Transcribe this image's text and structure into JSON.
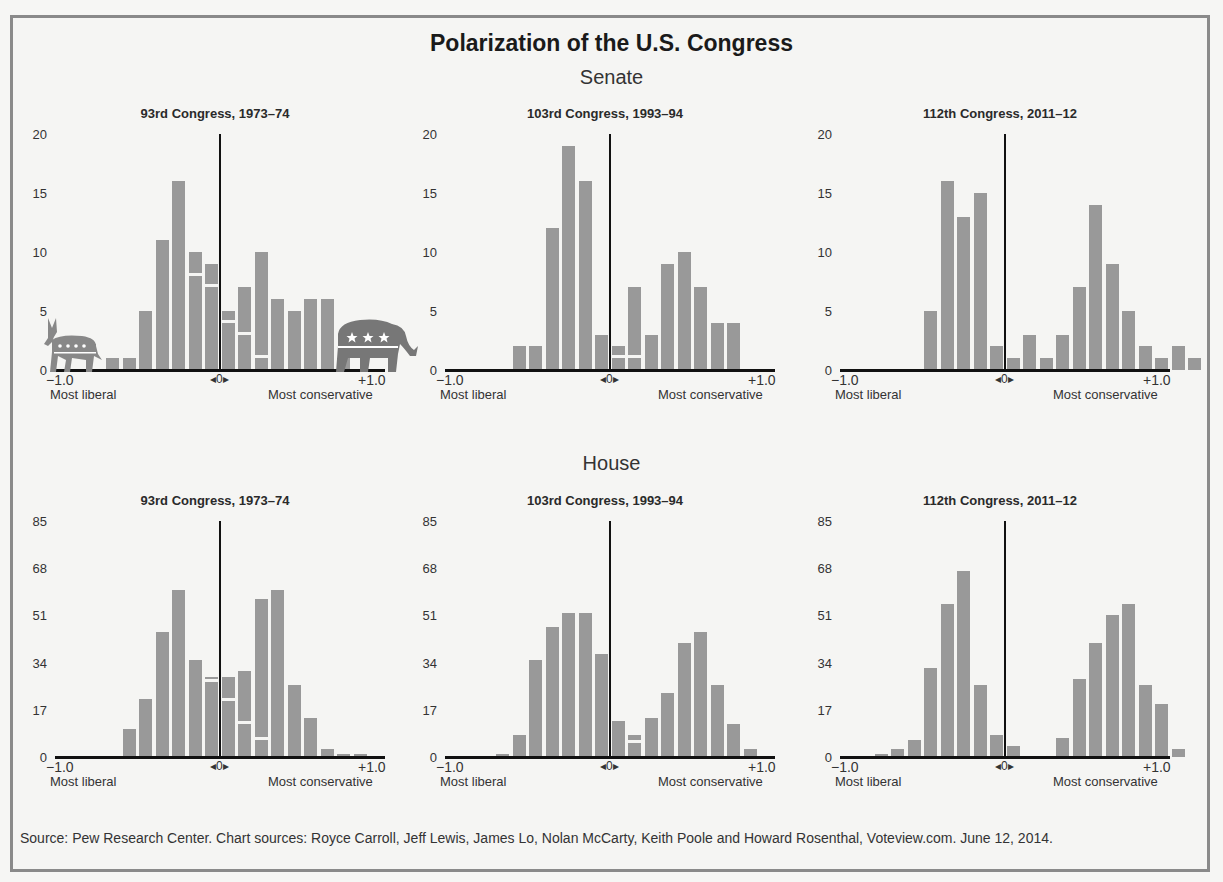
{
  "title": "Polarization of the U.S. Congress",
  "sections": {
    "senate": "Senate",
    "house": "House"
  },
  "axis": {
    "left_value": "−1.0",
    "center_value": "◂0▸",
    "right_value": "+1.0",
    "left_label": "Most liberal",
    "right_label": "Most conservative"
  },
  "icons": {
    "democrat": "donkey-icon",
    "republican": "elephant-icon"
  },
  "colors": {
    "bar": "#999999",
    "axis": "#111111",
    "background": "#f5f5f3"
  },
  "source": "Source: Pew Research Center. Chart sources: Royce Carroll, Jeff Lewis, James Lo, Nolan McCarty, Keith Poole and Howard Rosenthal, Voteview.com. June 12, 2014.",
  "chart_data": [
    {
      "type": "bar",
      "chamber": "Senate",
      "title": "93rd Congress, 1973–74",
      "xlabel": "Ideology (−1.0 most liberal to +1.0 most conservative)",
      "ylabel": "Number of members",
      "yticks": [
        "0",
        "5",
        "10",
        "15",
        "20"
      ],
      "ylim": [
        0,
        20
      ],
      "xlim": [
        -1.0,
        1.0
      ],
      "bin_width": 0.1,
      "bins": [
        -0.7,
        -0.6,
        -0.5,
        -0.4,
        -0.3,
        -0.2,
        -0.1,
        0.0,
        0.1,
        0.2,
        0.3,
        0.4,
        0.5,
        0.6
      ],
      "series": [
        {
          "name": "Democrats",
          "values": [
            1,
            1,
            5,
            11,
            16,
            8,
            7,
            4,
            3,
            1,
            0,
            0,
            0,
            0
          ]
        },
        {
          "name": "Republicans",
          "values": [
            0,
            0,
            0,
            0,
            0,
            2,
            2,
            1,
            4,
            9,
            6,
            5,
            6,
            6
          ]
        }
      ],
      "totals": [
        1,
        1,
        5,
        11,
        16,
        10,
        9,
        5,
        7,
        10,
        6,
        5,
        6,
        6
      ],
      "extra_bins": [
        {
          "bin": 0.7,
          "value": 1
        }
      ]
    },
    {
      "type": "bar",
      "chamber": "Senate",
      "title": "103rd Congress, 1993–94",
      "yticks": [
        "0",
        "5",
        "10",
        "15",
        "20"
      ],
      "ylim": [
        0,
        20
      ],
      "xlim": [
        -1.0,
        1.0
      ],
      "bin_width": 0.1,
      "bins": [
        -0.6,
        -0.5,
        -0.4,
        -0.3,
        -0.2,
        -0.1,
        0.0,
        0.1,
        0.2,
        0.3,
        0.4,
        0.5,
        0.6,
        0.7
      ],
      "series": [
        {
          "name": "Democrats",
          "values": [
            2,
            2,
            12,
            19,
            16,
            3,
            1,
            1,
            0,
            0,
            0,
            0,
            0,
            0
          ]
        },
        {
          "name": "Republicans",
          "values": [
            0,
            0,
            0,
            0,
            0,
            0,
            1,
            6,
            3,
            9,
            10,
            7,
            4,
            4
          ]
        }
      ],
      "totals": [
        2,
        2,
        12,
        19,
        16,
        3,
        2,
        7,
        3,
        9,
        10,
        7,
        4,
        4
      ]
    },
    {
      "type": "bar",
      "chamber": "Senate",
      "title": "112th Congress, 2011–12",
      "yticks": [
        "0",
        "5",
        "10",
        "15",
        "20"
      ],
      "ylim": [
        0,
        20
      ],
      "xlim": [
        -1.0,
        1.0
      ],
      "bin_width": 0.1,
      "bins": [
        -0.5,
        -0.4,
        -0.3,
        -0.2,
        -0.1,
        0.0,
        0.1,
        0.2,
        0.3,
        0.4,
        0.5,
        0.6,
        0.7,
        0.8,
        0.9
      ],
      "series": [
        {
          "name": "Democrats",
          "values": [
            5,
            16,
            13,
            15,
            2,
            1,
            0,
            0,
            0,
            0,
            0,
            0,
            0,
            0,
            0
          ]
        },
        {
          "name": "Republicans",
          "values": [
            0,
            0,
            0,
            0,
            0,
            0,
            3,
            1,
            3,
            7,
            14,
            9,
            5,
            2,
            1
          ]
        }
      ],
      "totals": [
        5,
        16,
        13,
        15,
        2,
        1,
        3,
        1,
        3,
        7,
        14,
        9,
        5,
        2,
        1
      ],
      "extra_bins": [
        {
          "bin": 1.0,
          "value": 2
        },
        {
          "bin": 1.1,
          "value": 1
        }
      ]
    },
    {
      "type": "bar",
      "chamber": "House",
      "title": "93rd Congress, 1973–74",
      "yticks": [
        "0",
        "17",
        "34",
        "51",
        "68",
        "85"
      ],
      "ylim": [
        0,
        85
      ],
      "xlim": [
        -1.0,
        1.0
      ],
      "bin_width": 0.1,
      "bins": [
        -0.6,
        -0.5,
        -0.4,
        -0.3,
        -0.2,
        -0.1,
        0.0,
        0.1,
        0.2,
        0.3,
        0.4,
        0.5,
        0.6,
        0.7,
        0.8
      ],
      "series": [
        {
          "name": "Democrats",
          "values": [
            10,
            21,
            45,
            60,
            35,
            27,
            20,
            12,
            6,
            0,
            0,
            0,
            0,
            0,
            0
          ]
        },
        {
          "name": "Republicans",
          "values": [
            0,
            0,
            0,
            0,
            0,
            2,
            9,
            19,
            51,
            60,
            26,
            14,
            3,
            1,
            1
          ]
        }
      ],
      "totals": [
        10,
        21,
        45,
        60,
        35,
        29,
        29,
        31,
        57,
        60,
        26,
        14,
        3,
        1,
        1
      ]
    },
    {
      "type": "bar",
      "chamber": "House",
      "title": "103rd Congress, 1993–94",
      "yticks": [
        "0",
        "17",
        "34",
        "51",
        "68",
        "85"
      ],
      "ylim": [
        0,
        85
      ],
      "xlim": [
        -1.0,
        1.0
      ],
      "bin_width": 0.1,
      "bins": [
        -0.7,
        -0.6,
        -0.5,
        -0.4,
        -0.3,
        -0.2,
        -0.1,
        0.0,
        0.1,
        0.2,
        0.3,
        0.4,
        0.5,
        0.6,
        0.7,
        0.8
      ],
      "series": [
        {
          "name": "Democrats",
          "values": [
            1,
            8,
            35,
            47,
            52,
            52,
            37,
            13,
            5,
            0,
            0,
            0,
            0,
            0,
            0,
            0
          ]
        },
        {
          "name": "Republicans",
          "values": [
            0,
            0,
            0,
            0,
            0,
            0,
            0,
            0,
            3,
            14,
            23,
            41,
            45,
            26,
            12,
            3
          ]
        }
      ],
      "totals": [
        1,
        8,
        35,
        47,
        52,
        52,
        37,
        13,
        8,
        14,
        23,
        41,
        45,
        26,
        12,
        3
      ]
    },
    {
      "type": "bar",
      "chamber": "House",
      "title": "112th Congress, 2011–12",
      "yticks": [
        "0",
        "17",
        "34",
        "51",
        "68",
        "85"
      ],
      "ylim": [
        0,
        85
      ],
      "xlim": [
        -1.0,
        1.0
      ],
      "bin_width": 0.1,
      "bins": [
        -0.8,
        -0.7,
        -0.6,
        -0.5,
        -0.4,
        -0.3,
        -0.2,
        -0.1,
        0.0,
        0.3,
        0.4,
        0.5,
        0.6,
        0.7,
        0.8,
        0.9,
        1.0
      ],
      "series": [
        {
          "name": "Democrats",
          "values": [
            1,
            3,
            6,
            32,
            55,
            67,
            26,
            8,
            4,
            0,
            0,
            0,
            0,
            0,
            0,
            0,
            0
          ]
        },
        {
          "name": "Republicans",
          "values": [
            0,
            0,
            0,
            0,
            0,
            0,
            0,
            0,
            0,
            7,
            28,
            41,
            51,
            55,
            26,
            19,
            3
          ]
        }
      ],
      "totals": [
        1,
        3,
        6,
        32,
        55,
        67,
        26,
        8,
        4,
        7,
        28,
        41,
        51,
        55,
        26,
        19,
        3
      ]
    }
  ]
}
